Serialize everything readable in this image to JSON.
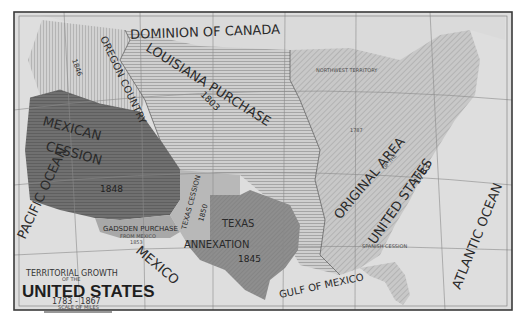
{
  "map": {
    "title_line1": "TERRITORIAL GROWTH",
    "title_line2": "OF THE",
    "title_main": "UNITED STATES",
    "title_years": "1783 - 1867",
    "scale_label": "SCALE OF MILES",
    "scale_ticks": [
      "0",
      "100",
      "200",
      "300",
      "400"
    ],
    "colors": {
      "paper": "#dcdcdc",
      "frame": "#3a3a3a",
      "canada": "#d6d6d6",
      "oregon": "#cacaca",
      "louisiana": "#c4c4c4",
      "mexican_cession": "#6e6e6e",
      "texas": "#8a8a8a",
      "texas_cession": "#b8b8b8",
      "gadsden": "#a5a5a5",
      "original": "#c0c0c0",
      "florida": "#b0b0b0",
      "water": "#e0e0e0"
    },
    "regions": {
      "canada": {
        "label": "DOMINION OF CANADA"
      },
      "oregon": {
        "label": "OREGON COUNTRY",
        "year": "1846"
      },
      "louisiana": {
        "label": "LOUISIANA PURCHASE",
        "year": "1803"
      },
      "mexican_cession": {
        "label_line1": "MEXICAN",
        "label_line2": "CESSION",
        "year": "1848"
      },
      "texas": {
        "label_line1": "TEXAS",
        "label_line2": "ANNEXATION",
        "year": "1845"
      },
      "texas_cession": {
        "label": "TEXAS CESSION",
        "year": "1850"
      },
      "gadsden": {
        "label": "GADSDEN PURCHASE",
        "sub": "FROM MEXICO",
        "year": "1853"
      },
      "original": {
        "label_line1": "ORIGINAL AREA",
        "label_line2": "OF THE",
        "label_line3": "UNITED STATES",
        "year": "1783"
      },
      "northwest": {
        "label": "NORTHWEST TERRITORY",
        "year": "1787"
      },
      "spanish": {
        "label": "SPANISH CESSION",
        "year": "1819"
      }
    },
    "water": {
      "pacific": "PACIFIC OCEAN",
      "atlantic": "ATLANTIC OCEAN",
      "gulf": "GULF OF MEXICO",
      "mexico": "MEXICO"
    }
  }
}
